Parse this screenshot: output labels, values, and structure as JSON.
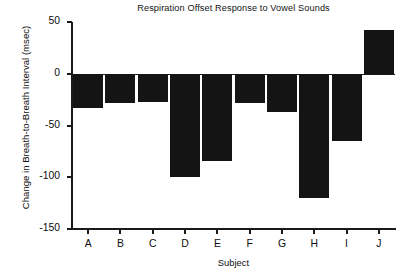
{
  "chart_data": {
    "type": "bar",
    "title": "Respiration Offset Response to Vowel Sounds",
    "xlabel": "Subject",
    "ylabel": "Change in Breath-to-Breath Interval (msec)",
    "categories": [
      "A",
      "B",
      "C",
      "D",
      "E",
      "F",
      "G",
      "H",
      "I",
      "J"
    ],
    "values": [
      -33,
      -28,
      -27,
      -100,
      -84,
      -28,
      -37,
      -120,
      -65,
      42
    ],
    "yticks": [
      50,
      0,
      -50,
      -100,
      -150
    ],
    "ytick_labels": [
      "50",
      "0",
      "-50",
      "-100",
      "-150"
    ],
    "ylim": [
      -150,
      50
    ],
    "grid": false,
    "legend": false,
    "bar_color": "#141414",
    "axis_color": "#1a1a1a",
    "background": "#ffffff"
  }
}
